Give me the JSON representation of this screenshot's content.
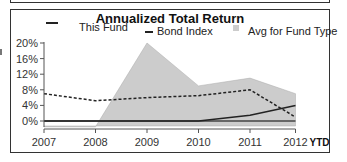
{
  "chart_data": {
    "type": "line",
    "title": "Annualized Total Return",
    "xlabel": "",
    "ylabel": "",
    "categories": [
      "2007",
      "2008",
      "2009",
      "2010",
      "2011",
      "2012"
    ],
    "x_suffix_label": "YTD",
    "y_ticks": [
      "20%",
      "16%",
      "12%",
      "8%",
      "4%",
      "0%"
    ],
    "ylim": [
      -2,
      20
    ],
    "grid": false,
    "legend_position": "top",
    "series": [
      {
        "name": "This Fund",
        "style": "solid",
        "color": "#222222",
        "values": [
          0,
          0,
          0,
          0,
          1.5,
          4
        ]
      },
      {
        "name": "Bond Index",
        "style": "dashed",
        "color": "#222222",
        "values": [
          7,
          5.2,
          6,
          6.5,
          8,
          1
        ]
      },
      {
        "name": "Avg for Fund Type",
        "style": "area",
        "color": "#cccccc",
        "values": [
          -1.5,
          -1.5,
          20,
          9,
          11,
          7
        ]
      }
    ]
  },
  "legend": {
    "this_fund": "This Fund",
    "bond_index": "Bond Index",
    "avg_fund_type": "Avg for Fund Type"
  }
}
